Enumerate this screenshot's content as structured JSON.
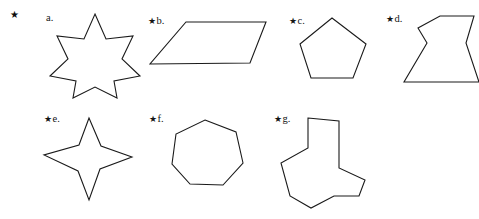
{
  "page": {
    "width": 479,
    "height": 219,
    "background": "#ffffff",
    "ink_color": "#1a1a1a"
  },
  "markers": {
    "star_glyph": "★",
    "standalone_star": {
      "name": "bullet-star-item-a",
      "x": 10,
      "y": 10
    }
  },
  "items": [
    {
      "id": "a",
      "label_text": "a.",
      "star_prefix": "",
      "label_x": 46,
      "label_y": 13,
      "shape_name": "eight-pointed-star",
      "points": "95,14 106,39 133,36 122,59 140,76 114,81 117,98 95,87 73,98 76,81 50,76 68,59 57,36 84,39"
    },
    {
      "id": "b",
      "label_text": "b.",
      "star_prefix": "★",
      "label_x": 148,
      "label_y": 16,
      "shape_name": "parallelogram",
      "points": "186,22 266,22 250,63 150,64"
    },
    {
      "id": "c",
      "label_text": "c.",
      "star_prefix": "★",
      "label_x": 289,
      "label_y": 16,
      "shape_name": "pentagon",
      "points": "332,18 366,44 353,78 311,78 300,44"
    },
    {
      "id": "d",
      "label_text": "d.",
      "star_prefix": "★",
      "label_x": 386,
      "label_y": 14,
      "shape_name": "concave-hourglass",
      "points": "440,16 474,16 466,43 479,82 404,82 427,43 418,28"
    },
    {
      "id": "e",
      "label_text": "e.",
      "star_prefix": "★",
      "label_x": 44,
      "label_y": 114,
      "shape_name": "four-pointed-star",
      "points": "89,118 101,146 132,157 100,169 89,200 78,171 44,155 79,145"
    },
    {
      "id": "f",
      "label_text": "f.",
      "star_prefix": "★",
      "label_x": 149,
      "label_y": 114,
      "shape_name": "heptagon",
      "points": "205,120 236,132 243,163 223,185 190,184 172,164 176,134"
    },
    {
      "id": "g",
      "label_text": "g.",
      "star_prefix": "★",
      "label_x": 274,
      "label_y": 114,
      "shape_name": "concave-tri-lobed-polygon",
      "points": "308,118 339,121 339,168 365,180 359,196 334,196 311,208 290,196 281,163 308,148"
    }
  ]
}
